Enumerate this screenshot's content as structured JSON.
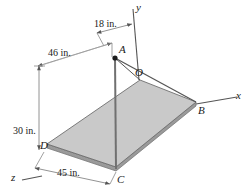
{
  "figure": {
    "type": "engineering-mechanics-diagram",
    "background_color": "#ffffff",
    "plate_fill_color": "#c9c9c9",
    "plate_edge_color": "#8c8c8c",
    "line_color": "#555555",
    "text_color": "#1a1a1a"
  },
  "axes": [
    {
      "id": "x-axis",
      "label": "x"
    },
    {
      "id": "y-axis",
      "label": "y"
    },
    {
      "id": "z-axis",
      "label": "z"
    }
  ],
  "points": [
    {
      "id": "point-a",
      "label": "A"
    },
    {
      "id": "point-b",
      "label": "B"
    },
    {
      "id": "point-c",
      "label": "C"
    },
    {
      "id": "point-d",
      "label": "D"
    },
    {
      "id": "point-o",
      "label": "O"
    }
  ],
  "dimensions": [
    {
      "id": "dim-18",
      "label": "18 in."
    },
    {
      "id": "dim-46",
      "label": "46 in."
    },
    {
      "id": "dim-30",
      "label": "30 in."
    },
    {
      "id": "dim-45",
      "label": "45 in."
    }
  ]
}
